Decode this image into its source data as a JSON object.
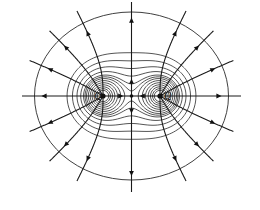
{
  "figure": {
    "width": 260,
    "height": 210,
    "colors": {
      "line": "#1a1a1a",
      "background": "#ffffff"
    }
  },
  "charges": [
    {
      "label": "Q",
      "x": 103,
      "y": 96,
      "sign": "positive",
      "label_dx": -9,
      "label_dy": 3
    },
    {
      "label": "Q",
      "x": 160,
      "y": 96,
      "sign": "positive",
      "label_dx": 4,
      "label_dy": 3
    }
  ],
  "saddle_point": {
    "x": 131.5,
    "y": 96
  },
  "outer_boundary": {
    "cx": 131.5,
    "cy": 96,
    "rx": 97,
    "ry": 84
  },
  "equipotentials": {
    "count": 12,
    "description": "closed contours around each charge merging into ovals around both"
  },
  "field_lines": {
    "angles_deg_from_left_charge": [
      180,
      150,
      120,
      90,
      210,
      240,
      270
    ],
    "angles_deg_from_right_charge": [
      0,
      30,
      60,
      90,
      330,
      300,
      270
    ],
    "central_axis": [
      "up",
      "down"
    ],
    "direction": "outward"
  }
}
